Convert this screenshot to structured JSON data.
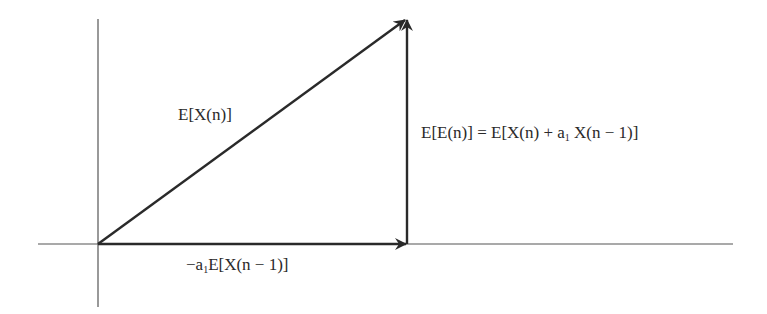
{
  "diagram": {
    "type": "vector-triangle",
    "axes": {
      "origin": [
        98,
        244
      ],
      "x_axis": {
        "from": 38,
        "to": 733
      },
      "y_axis": {
        "from": 19,
        "to": 307
      }
    },
    "vectors": [
      {
        "name": "E[X(n)]",
        "from": [
          98,
          244
        ],
        "to": [
          407,
          18
        ]
      },
      {
        "name": "-a1 E[X(n - 1)]",
        "from": [
          98,
          244
        ],
        "to": [
          407,
          244
        ]
      },
      {
        "name": "E[E(n)]",
        "from": [
          407,
          244
        ],
        "to": [
          407,
          18
        ]
      }
    ],
    "labels": {
      "hypotenuse": {
        "prefix": "E[X(n)]"
      },
      "horizontal": {
        "prefix": "−a",
        "sub": "1",
        "suffix": "E[X(n − 1)]"
      },
      "vertical": {
        "prefix": "E[E(n)] = E[X(n) + a",
        "sub": "1",
        "suffix": " X(n − 1)]"
      }
    },
    "colors": {
      "line": "#2a2a2a",
      "axis": "#555555"
    }
  }
}
